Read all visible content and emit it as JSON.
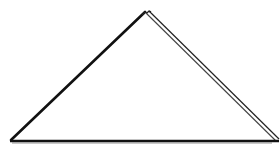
{
  "diagram": {
    "shape": "triangle",
    "style": "outline",
    "stroke_color": "#111111",
    "secondary_stroke_color": "#555555",
    "background": "#ffffff",
    "vertices": {
      "apex": [
        148,
        10
      ],
      "left": [
        10,
        140
      ],
      "right": [
        278,
        140
      ]
    }
  }
}
